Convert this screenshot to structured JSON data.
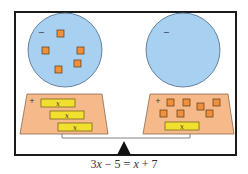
{
  "colors": {
    "frame": "#1a1a1a",
    "circle_fill": "#a8d0f0",
    "circle_stroke": "#4a6a88",
    "tray_fill": "#f5b98a",
    "tray_stroke": "#8a6a50",
    "unit_tile_fill": "#f0903a",
    "unit_tile_stroke": "#5a3a1a",
    "x_tile_fill": "#f2e030",
    "x_tile_stroke": "#6a5a10",
    "beam": "#666666",
    "fulcrum": "#111111"
  },
  "left_pan": {
    "negative_sign": "−",
    "positive_sign": "+",
    "negative_units": 5,
    "x_tiles": 3,
    "x_tile_label": "x"
  },
  "right_pan": {
    "negative_sign": "−",
    "positive_sign": "+",
    "negative_units": 0,
    "positive_units": 7,
    "x_tiles": 1,
    "x_tile_label": "x"
  },
  "equation": {
    "text": "3x − 5 = x + 7",
    "coef_left": "3",
    "var": "x",
    "minus": " − ",
    "const_left": "5",
    "equals": " = ",
    "plus": " + ",
    "const_right": "7"
  }
}
